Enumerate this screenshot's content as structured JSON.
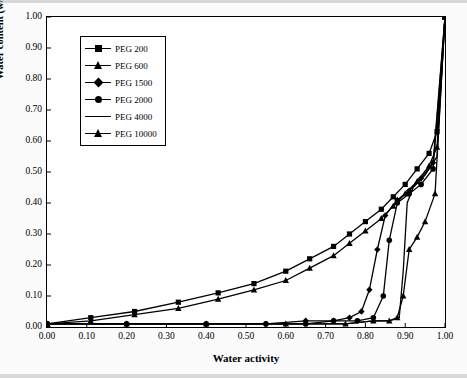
{
  "chart_data": {
    "type": "line",
    "title": "",
    "xlabel": "Water activity",
    "ylabel": "Water content (w/w)",
    "xlim": [
      0.0,
      1.0
    ],
    "ylim": [
      0.0,
      1.0
    ],
    "xticks": [
      "0.00",
      "0.10",
      "0.20",
      "0.30",
      "0.40",
      "0.50",
      "0.60",
      "0.70",
      "0.80",
      "0.90",
      "1.00"
    ],
    "yticks": [
      "0.00",
      "0.10",
      "0.20",
      "0.30",
      "0.40",
      "0.50",
      "0.60",
      "0.70",
      "0.80",
      "0.90",
      "1.00"
    ],
    "grid": false,
    "legend_position": "upper-left-inside",
    "series": [
      {
        "name": "PEG 200",
        "marker": "square",
        "x": [
          0.0,
          0.11,
          0.22,
          0.33,
          0.43,
          0.52,
          0.6,
          0.66,
          0.72,
          0.76,
          0.8,
          0.84,
          0.87,
          0.9,
          0.93,
          0.96,
          0.98,
          1.0
        ],
        "y": [
          0.01,
          0.03,
          0.05,
          0.08,
          0.11,
          0.14,
          0.18,
          0.22,
          0.26,
          0.3,
          0.34,
          0.38,
          0.42,
          0.46,
          0.51,
          0.56,
          0.63,
          1.0
        ]
      },
      {
        "name": "PEG 600",
        "marker": "triangle",
        "x": [
          0.0,
          0.11,
          0.22,
          0.33,
          0.43,
          0.52,
          0.6,
          0.66,
          0.72,
          0.76,
          0.8,
          0.84,
          0.87,
          0.9,
          0.93,
          0.96,
          0.98,
          1.0
        ],
        "y": [
          0.01,
          0.02,
          0.04,
          0.06,
          0.09,
          0.12,
          0.15,
          0.19,
          0.23,
          0.27,
          0.31,
          0.35,
          0.39,
          0.43,
          0.47,
          0.52,
          0.58,
          1.0
        ]
      },
      {
        "name": "PEG 1500",
        "marker": "diamond",
        "x": [
          0.0,
          0.2,
          0.4,
          0.55,
          0.65,
          0.72,
          0.76,
          0.79,
          0.81,
          0.83,
          0.85,
          0.88,
          0.91,
          0.94,
          0.97,
          1.0
        ],
        "y": [
          0.01,
          0.01,
          0.01,
          0.01,
          0.02,
          0.02,
          0.03,
          0.05,
          0.12,
          0.25,
          0.36,
          0.41,
          0.44,
          0.48,
          0.53,
          1.0
        ]
      },
      {
        "name": "PEG 2000",
        "marker": "circle",
        "x": [
          0.0,
          0.2,
          0.4,
          0.55,
          0.65,
          0.72,
          0.78,
          0.82,
          0.845,
          0.86,
          0.88,
          0.91,
          0.94,
          0.97,
          1.0
        ],
        "y": [
          0.01,
          0.01,
          0.01,
          0.01,
          0.01,
          0.02,
          0.02,
          0.03,
          0.1,
          0.28,
          0.4,
          0.43,
          0.46,
          0.51,
          1.0
        ]
      },
      {
        "name": "PEG 4000",
        "marker": "none",
        "x": [
          0.0,
          0.2,
          0.4,
          0.6,
          0.75,
          0.82,
          0.86,
          0.885,
          0.895,
          0.905,
          0.92,
          0.95,
          0.98,
          1.0
        ],
        "y": [
          0.01,
          0.01,
          0.01,
          0.01,
          0.01,
          0.02,
          0.02,
          0.03,
          0.18,
          0.4,
          0.45,
          0.49,
          0.55,
          1.0
        ]
      },
      {
        "name": "PEG 10000",
        "marker": "triangle",
        "x": [
          0.0,
          0.2,
          0.4,
          0.6,
          0.75,
          0.82,
          0.86,
          0.88,
          0.895,
          0.91,
          0.93,
          0.95,
          0.975,
          1.0
        ],
        "y": [
          0.01,
          0.01,
          0.01,
          0.01,
          0.01,
          0.02,
          0.02,
          0.03,
          0.1,
          0.25,
          0.29,
          0.34,
          0.43,
          1.0
        ]
      }
    ]
  },
  "legend": {
    "items": [
      {
        "label": "PEG 200"
      },
      {
        "label": "PEG 600"
      },
      {
        "label": "PEG 1500"
      },
      {
        "label": "PEG 2000"
      },
      {
        "label": "PEG 4000"
      },
      {
        "label": "PEG 10000"
      }
    ]
  },
  "axes": {
    "x_title": "Water activity",
    "y_title": "Water content (w/w)"
  }
}
